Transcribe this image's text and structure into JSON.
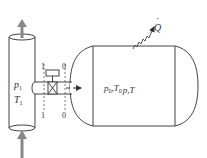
{
  "diagram": {
    "supply_line": {
      "pressure_label": "p",
      "pressure_sub": "1",
      "temperature_label": "T",
      "temperature_sub": "1"
    },
    "sections": {
      "inlet_label": "1",
      "tank_label": "0"
    },
    "tank": {
      "state_text_initial_p": "p",
      "state_text_initial_p_sub": "0",
      "state_text_sep1": ",",
      "state_text_initial_T": "T",
      "state_text_initial_T_sub": "0",
      "state_arrow": "→",
      "state_text_final_p": "p",
      "state_text_sep2": ",",
      "state_text_final_T": "T"
    },
    "heat": {
      "label": "Q",
      "dot": "·"
    },
    "colors": {
      "stroke": "#444444",
      "arrow_fill": "#888888"
    }
  }
}
